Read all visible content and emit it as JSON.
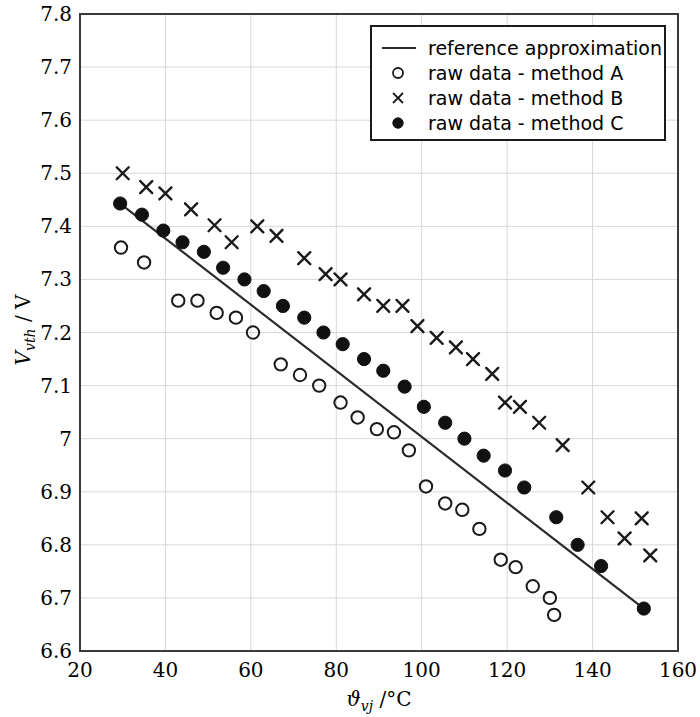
{
  "chart_data": {
    "type": "scatter",
    "title": "",
    "xlabel": "ϑvj / °C",
    "ylabel": "Vvth / V",
    "xlabel_parts": {
      "symbol": "ϑ",
      "subscript": "vj",
      "unit": "/ °C"
    },
    "ylabel_parts": {
      "symbol": "V",
      "subscript": "vth",
      "unit": "/ V"
    },
    "xlim": [
      20,
      160
    ],
    "ylim": [
      6.6,
      7.8
    ],
    "xticks": [
      20,
      40,
      60,
      80,
      100,
      120,
      140,
      160
    ],
    "yticks": [
      "6.6",
      "6.7",
      "6.8",
      "6.9",
      "7",
      "7.1",
      "7.2",
      "7.3",
      "7.4",
      "7.5",
      "7.6",
      "7.7",
      "7.8"
    ],
    "grid": true,
    "grid_color": "#d8d8d8",
    "axis_color": "#3a3a3a",
    "legend_position": "top-right",
    "series": [
      {
        "name": "reference approximation",
        "marker": "line",
        "color": "#2b2b2b",
        "x": [
          29.4,
          152.0
        ],
        "y": [
          7.443,
          6.68
        ]
      },
      {
        "name": "raw data - method A",
        "marker": "open-circle",
        "color": "#1a1a1a",
        "points": [
          [
            29.6,
            7.36
          ],
          [
            35.0,
            7.332
          ],
          [
            43.0,
            7.26
          ],
          [
            47.5,
            7.26
          ],
          [
            52.0,
            7.237
          ],
          [
            56.5,
            7.228
          ],
          [
            60.5,
            7.2
          ],
          [
            67.0,
            7.14
          ],
          [
            71.5,
            7.12
          ],
          [
            76.0,
            7.1
          ],
          [
            81.0,
            7.068
          ],
          [
            85.0,
            7.04
          ],
          [
            89.5,
            7.018
          ],
          [
            93.5,
            7.012
          ],
          [
            97.0,
            6.978
          ],
          [
            101.0,
            6.91
          ],
          [
            105.5,
            6.878
          ],
          [
            109.5,
            6.866
          ],
          [
            113.5,
            6.83
          ],
          [
            118.5,
            6.772
          ],
          [
            122.0,
            6.758
          ],
          [
            126.0,
            6.722
          ],
          [
            130.0,
            6.7
          ],
          [
            131.0,
            6.668
          ]
        ]
      },
      {
        "name": "raw data - method B",
        "marker": "cross",
        "color": "#1a1a1a",
        "points": [
          [
            30.0,
            7.5
          ],
          [
            35.5,
            7.474
          ],
          [
            40.0,
            7.462
          ],
          [
            46.0,
            7.432
          ],
          [
            51.5,
            7.402
          ],
          [
            55.5,
            7.37
          ],
          [
            61.5,
            7.4
          ],
          [
            66.0,
            7.382
          ],
          [
            72.5,
            7.34
          ],
          [
            77.5,
            7.31
          ],
          [
            81.0,
            7.3
          ],
          [
            86.5,
            7.272
          ],
          [
            91.0,
            7.25
          ],
          [
            95.5,
            7.25
          ],
          [
            99.0,
            7.212
          ],
          [
            103.5,
            7.19
          ],
          [
            108.0,
            7.172
          ],
          [
            112.0,
            7.15
          ],
          [
            116.5,
            7.122
          ],
          [
            119.5,
            7.068
          ],
          [
            123.0,
            7.06
          ],
          [
            127.5,
            7.03
          ],
          [
            133.0,
            6.988
          ],
          [
            139.0,
            6.908
          ],
          [
            143.5,
            6.852
          ],
          [
            147.5,
            6.812
          ],
          [
            151.5,
            6.85
          ],
          [
            153.5,
            6.78
          ]
        ]
      },
      {
        "name": "raw data - method C",
        "marker": "filled-circle",
        "color": "#111111",
        "points": [
          [
            29.4,
            7.443
          ],
          [
            34.5,
            7.422
          ],
          [
            39.5,
            7.392
          ],
          [
            44.0,
            7.37
          ],
          [
            49.0,
            7.352
          ],
          [
            53.5,
            7.322
          ],
          [
            58.5,
            7.3
          ],
          [
            63.0,
            7.278
          ],
          [
            67.5,
            7.25
          ],
          [
            72.5,
            7.228
          ],
          [
            77.0,
            7.2
          ],
          [
            81.5,
            7.178
          ],
          [
            86.5,
            7.15
          ],
          [
            91.0,
            7.128
          ],
          [
            96.0,
            7.098
          ],
          [
            100.5,
            7.06
          ],
          [
            105.5,
            7.03
          ],
          [
            110.0,
            7.0
          ],
          [
            114.5,
            6.968
          ],
          [
            119.5,
            6.94
          ],
          [
            124.0,
            6.908
          ],
          [
            131.5,
            6.852
          ],
          [
            136.5,
            6.8
          ],
          [
            142.0,
            6.76
          ],
          [
            152.0,
            6.68
          ]
        ]
      }
    ]
  },
  "legend": {
    "items": [
      {
        "label": "reference approximation",
        "marker": "line"
      },
      {
        "label": "raw data - method A",
        "marker": "open-circle"
      },
      {
        "label": "raw data - method B",
        "marker": "cross"
      },
      {
        "label": "raw data - method C",
        "marker": "filled-circle"
      }
    ]
  },
  "axes": {
    "x_tick_labels": [
      "20",
      "40",
      "60",
      "80",
      "100",
      "120",
      "140",
      "160"
    ],
    "y_tick_labels": [
      "6.6",
      "6.7",
      "6.8",
      "6.9",
      "7",
      "7.1",
      "7.2",
      "7.3",
      "7.4",
      "7.5",
      "7.6",
      "7.7",
      "7.8"
    ]
  }
}
